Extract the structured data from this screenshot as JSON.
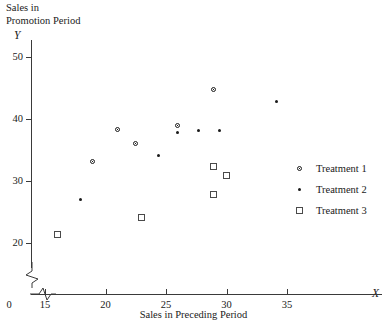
{
  "chart_data": {
    "type": "scatter",
    "title": "",
    "ylabel_lines": "Sales in\nPromotion Period",
    "xlabel": "Sales in Preceding Period",
    "x_var": "X",
    "y_var": "Y",
    "origin_label": "0",
    "xlim": [
      14,
      38
    ],
    "ylim": [
      18.5,
      52
    ],
    "xticks": [
      15,
      20,
      25,
      30,
      35
    ],
    "yticks": [
      20,
      30,
      40,
      50
    ],
    "grid": false,
    "axis_break_x": true,
    "axis_break_y": true,
    "legend_position": "right",
    "series": [
      {
        "name": "Treatment 1",
        "marker": "circle-open-dot",
        "points": [
          {
            "x": 19.0,
            "y": 33.0
          },
          {
            "x": 21.0,
            "y": 38.2
          },
          {
            "x": 22.5,
            "y": 36.0
          },
          {
            "x": 26.0,
            "y": 38.8
          },
          {
            "x": 29.0,
            "y": 44.7
          }
        ]
      },
      {
        "name": "Treatment 2",
        "marker": "dot-filled",
        "points": [
          {
            "x": 18.0,
            "y": 27.0
          },
          {
            "x": 24.4,
            "y": 34.0
          },
          {
            "x": 26.0,
            "y": 37.8
          },
          {
            "x": 27.7,
            "y": 38.0
          },
          {
            "x": 29.5,
            "y": 38.0
          },
          {
            "x": 34.2,
            "y": 42.7
          }
        ]
      },
      {
        "name": "Treatment 3",
        "marker": "square-open",
        "points": [
          {
            "x": 16.1,
            "y": 21.3
          },
          {
            "x": 23.0,
            "y": 24.0
          },
          {
            "x": 29.0,
            "y": 32.2
          },
          {
            "x": 30.0,
            "y": 30.8
          },
          {
            "x": 29.0,
            "y": 27.8
          }
        ]
      }
    ],
    "legend": [
      {
        "label": "Treatment 1",
        "marker": "circle-open-dot"
      },
      {
        "label": "Treatment 2",
        "marker": "dot-filled"
      },
      {
        "label": "Treatment 3",
        "marker": "square-open"
      }
    ]
  }
}
